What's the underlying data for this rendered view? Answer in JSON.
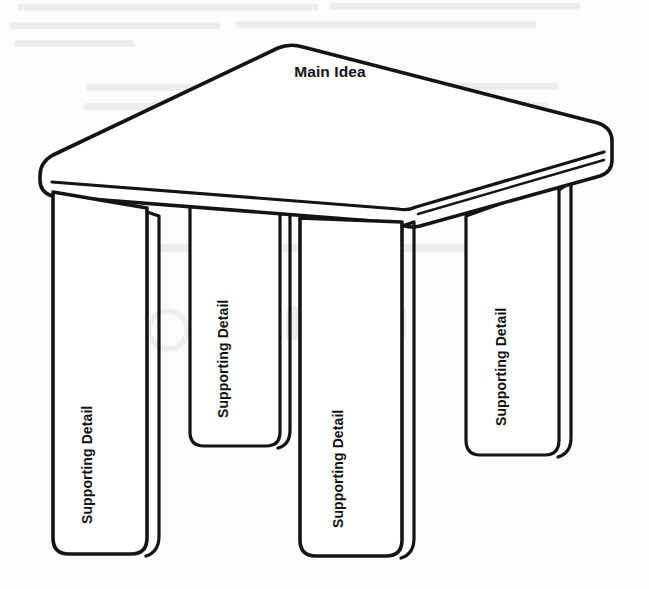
{
  "document": {
    "kind": "graphic-organizer",
    "shape": "table",
    "background_color": "#fcfcfc",
    "ink_color": "#141414"
  },
  "labels": {
    "main_idea": "Main Idea",
    "supporting_detail": "Supporting Detail"
  },
  "table": {
    "top_label": "Main Idea",
    "legs": [
      {
        "id": "front-left",
        "label": "Supporting Detail"
      },
      {
        "id": "rear-left",
        "label": "Supporting Detail"
      },
      {
        "id": "front-right",
        "label": "Supporting Detail"
      },
      {
        "id": "rear-right",
        "label": "Supporting Detail"
      }
    ]
  }
}
